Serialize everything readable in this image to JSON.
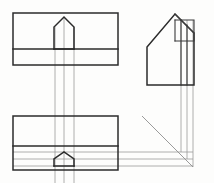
{
  "drawing": {
    "title": "Orthographic Projection Exercise",
    "background_color": "#fdfdfc",
    "object_line_color": "#2b2b2b",
    "projection_line_color": "#9a9a9a",
    "miter_line_color": "#8f8f8f",
    "canvas": {
      "width": 214,
      "height": 183
    },
    "views": [
      {
        "id": "top-left-view",
        "name": "front-view",
        "label": "",
        "box": {
          "x": 13,
          "y": 13,
          "width": 105,
          "height": 52
        },
        "divider_y": 49,
        "feature": {
          "type": "gable-peak",
          "left_x": 54,
          "right_x": 74,
          "base_y": 49,
          "shoulder_y": 27,
          "apex_x": 64,
          "apex_y": 17
        }
      },
      {
        "id": "bottom-left-view",
        "name": "top-view",
        "label": "",
        "box": {
          "x": 13,
          "y": 116,
          "width": 105,
          "height": 54
        },
        "divider_y": 146,
        "feature": {
          "type": "small-gable-peak",
          "left_x": 54,
          "right_x": 74,
          "base_y": 166,
          "shoulder_y": 159,
          "apex_x": 64,
          "apex_y": 152
        }
      },
      {
        "id": "right-pictorial-view",
        "name": "side-view",
        "label": "",
        "outline": {
          "base_left_x": 147,
          "base_right_x": 194,
          "base_y": 85,
          "eave_left_y": 47,
          "apex_x": 175,
          "apex_y": 14
        },
        "detail_box": {
          "x": 175,
          "y": 20,
          "width": 19,
          "height": 21
        }
      }
    ],
    "projection_lines": {
      "vertical_between_left_views": [
        {
          "x": 55,
          "y1": 27,
          "y2": 183
        },
        {
          "x": 64,
          "y1": 17,
          "y2": 183
        },
        {
          "x": 74,
          "y1": 27,
          "y2": 183
        }
      ],
      "horizontal_to_miter": [
        {
          "y": 152,
          "x1": 13,
          "x2": 192
        },
        {
          "y": 159,
          "x1": 13,
          "x2": 192
        },
        {
          "y": 166,
          "x1": 13,
          "x2": 192
        }
      ],
      "vertical_to_right_view": [
        {
          "x": 181,
          "y1": 20,
          "y2": 152
        },
        {
          "x": 187,
          "y1": 20,
          "y2": 159
        },
        {
          "x": 193,
          "y1": 20,
          "y2": 166
        }
      ]
    },
    "miter_line": {
      "x1": 142,
      "y1": 116,
      "x2": 193,
      "y2": 167,
      "angle_degrees": 45
    }
  }
}
